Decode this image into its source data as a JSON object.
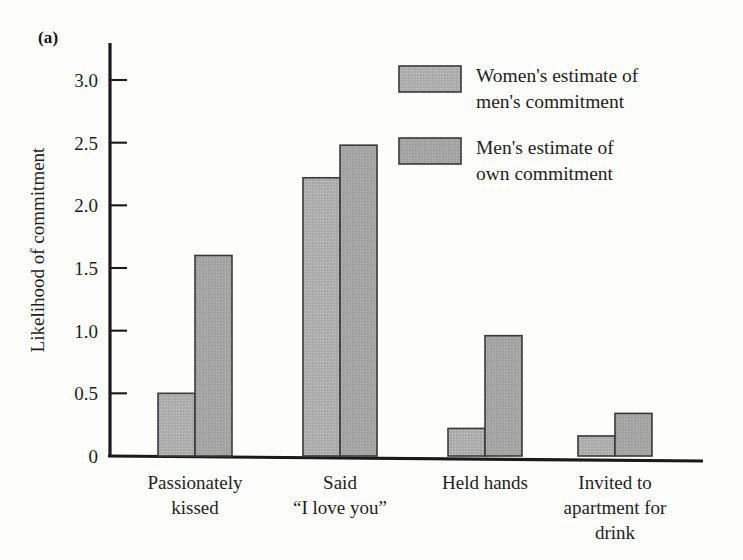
{
  "panel": {
    "label": "(a)"
  },
  "chart_data": {
    "type": "bar",
    "title": "",
    "subtitle": "",
    "xlabel": "",
    "ylabel": "Likelihood of commitment",
    "ylim": [
      0,
      3.2
    ],
    "yticks": [
      0,
      0.5,
      1.0,
      1.5,
      2.0,
      2.5,
      3.0
    ],
    "ytick_labels": [
      "0",
      "0.5",
      "1.0",
      "1.5",
      "2.0",
      "2.5",
      "3.0"
    ],
    "grid": false,
    "legend_position": "top-right",
    "categories": [
      "Passionately\nkissed",
      "Said\n“I love you”",
      "Held hands",
      "Invited to\napartment for\ndrink"
    ],
    "category_lines": [
      [
        "Passionately",
        "kissed"
      ],
      [
        "Said",
        "“I love you”"
      ],
      [
        "Held hands"
      ],
      [
        "Invited to",
        "apartment for",
        "drink"
      ]
    ],
    "series": [
      {
        "name": "Women's estimate of men's commitment",
        "name_lines": [
          "Women's estimate of",
          "men's commitment"
        ],
        "color": "#b3b3b3",
        "values": [
          0.5,
          2.22,
          0.22,
          0.16
        ]
      },
      {
        "name": "Men's estimate of own commitment",
        "name_lines": [
          "Men's estimate of",
          "own commitment"
        ],
        "color": "#a8a8a8",
        "values": [
          1.6,
          2.48,
          0.96,
          0.34
        ]
      }
    ],
    "annotations": []
  },
  "style": {
    "axis_color": "#1a1a1a",
    "bar_edge_color": "#3a3a3a",
    "background": "#fdfdfc"
  }
}
